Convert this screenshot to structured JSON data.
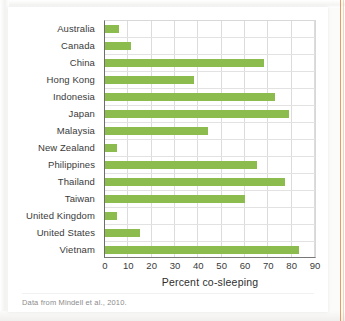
{
  "figure": {
    "source_note": "Data from Mindell et al., 2010."
  },
  "chart_data": {
    "type": "bar",
    "orientation": "horizontal",
    "title": "",
    "xlabel": "Percent co-sleeping",
    "ylabel": "",
    "xlim": [
      0,
      90
    ],
    "xticks": [
      0,
      10,
      20,
      30,
      40,
      50,
      60,
      70,
      80,
      90
    ],
    "grid": true,
    "legend": false,
    "bar_color": "#8cbb4e",
    "categories": [
      "Australia",
      "Canada",
      "China",
      "Hong Kong",
      "Indonesia",
      "Japan",
      "Malaysia",
      "New Zealand",
      "Philippines",
      "Thailand",
      "Taiwan",
      "United Kingdom",
      "United  States",
      "Vietnam"
    ],
    "values": [
      6,
      11,
      68,
      38,
      73,
      79,
      44,
      5,
      65,
      77,
      60,
      5,
      15,
      83
    ]
  }
}
